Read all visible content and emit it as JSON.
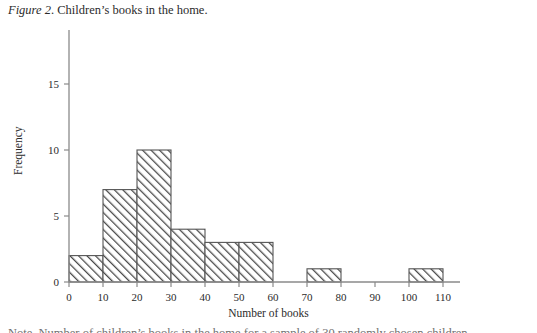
{
  "caption": {
    "figure_label": "Figure 2",
    "separator": ". ",
    "text": "Children’s books in the home."
  },
  "footer": {
    "text": "Note. Number of children’s books in the home for a sample of 30 randomly chosen children."
  },
  "colors": {
    "axis": "#8a8a8a",
    "bar_outline": "#555555",
    "hatch": "#4a4a4a",
    "text": "#2b2b2b",
    "background": "#ffffff"
  },
  "chart_data": {
    "type": "bar",
    "subtype": "histogram",
    "title": "",
    "subtitle": "",
    "xlabel": "Number of books",
    "ylabel": "Frequency",
    "xlim": [
      0,
      115
    ],
    "ylim": [
      0,
      17
    ],
    "grid": false,
    "legend": false,
    "legend_position": "none",
    "bin_width": 10,
    "bin_edges": [
      0,
      10,
      20,
      30,
      40,
      50,
      60,
      70,
      80,
      90,
      100,
      110
    ],
    "categories": [
      "0–10",
      "10–20",
      "20–30",
      "30–40",
      "40–50",
      "50–60",
      "60–70",
      "70–80",
      "80–90",
      "90–100",
      "100–110"
    ],
    "values": [
      2,
      7,
      10,
      4,
      3,
      3,
      0,
      1,
      0,
      0,
      1
    ],
    "xticks": [
      0,
      10,
      20,
      30,
      40,
      50,
      60,
      70,
      80,
      90,
      100,
      110
    ],
    "xtick_labels": [
      "0",
      "10",
      "20",
      "30",
      "40",
      "50",
      "60",
      "70",
      "80",
      "90",
      "100",
      "110"
    ],
    "yticks": [
      0,
      5,
      10,
      15
    ],
    "ytick_labels": [
      "0",
      "5",
      "10",
      "15"
    ],
    "total_count": 31
  }
}
